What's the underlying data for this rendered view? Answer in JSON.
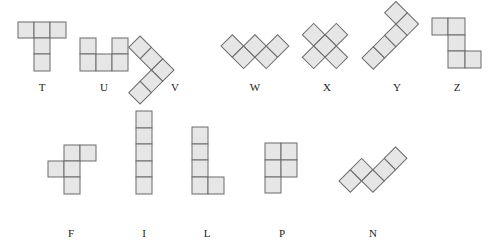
{
  "figure": {
    "cell_fill": "#e6e6e6",
    "cell_stroke": "#6b6b6b",
    "background": "#ffffff"
  },
  "pentominoes": [
    {
      "name": "T",
      "label_pos": [
        42,
        82
      ]
    },
    {
      "name": "U",
      "label_pos": [
        104,
        82
      ]
    },
    {
      "name": "V",
      "label_pos": [
        175,
        82
      ]
    },
    {
      "name": "W",
      "label_pos": [
        255,
        82
      ]
    },
    {
      "name": "X",
      "label_pos": [
        327,
        82
      ]
    },
    {
      "name": "Y",
      "label_pos": [
        397,
        82
      ]
    },
    {
      "name": "Z",
      "label_pos": [
        457,
        82
      ]
    },
    {
      "name": "F",
      "label_pos": [
        71,
        228
      ]
    },
    {
      "name": "I",
      "label_pos": [
        144,
        228
      ]
    },
    {
      "name": "L",
      "label_pos": [
        207,
        228
      ]
    },
    {
      "name": "P",
      "label_pos": [
        282,
        228
      ]
    },
    {
      "name": "N",
      "label_pos": [
        373,
        228
      ]
    }
  ]
}
